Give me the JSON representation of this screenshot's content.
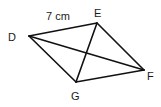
{
  "diagram": {
    "type": "quadrilateral",
    "stroke_color": "#111111",
    "background": "#ffffff",
    "vertices": {
      "D": {
        "x": 29,
        "y": 36,
        "label": "D"
      },
      "E": {
        "x": 97,
        "y": 23,
        "label": "E"
      },
      "F": {
        "x": 144,
        "y": 70,
        "label": "F"
      },
      "G": {
        "x": 76,
        "y": 82,
        "label": "G"
      }
    },
    "sides": [
      "DE",
      "EF",
      "FG",
      "GD"
    ],
    "diagonals": [
      "DF",
      "EG"
    ],
    "measurement": {
      "side": "DE",
      "text": "7 cm"
    }
  }
}
